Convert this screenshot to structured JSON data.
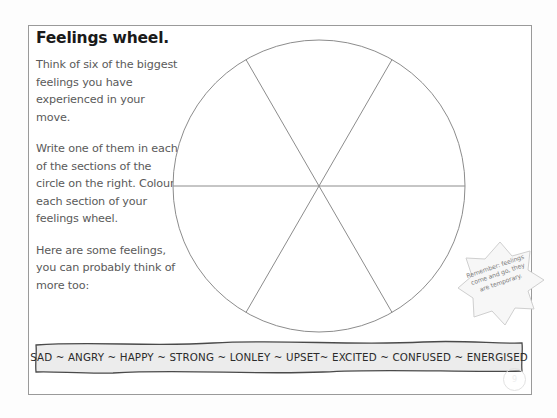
{
  "worksheet": {
    "title": "Feelings wheel.",
    "paragraphs": [
      "Think of six of the biggest feelings you have experienced in your move.",
      "Write one of them in each of the sections of the circle on the right. Colour each section of your feelings wheel.",
      "Here are some feelings, you can probably think of more too:"
    ]
  },
  "wheel": {
    "sections": 6,
    "center_x": 149,
    "center_y": 149,
    "radius": 146,
    "divider_angles_deg": [
      0,
      60,
      120
    ],
    "stroke_color": "#8c8c8c"
  },
  "reminder": {
    "text": "Remember: feelings come and go, they are temporary.",
    "shape": "starburst",
    "points": 8,
    "rotation_deg": -19,
    "fill_color": "#f7f7f7",
    "stroke_color": "#cfcfcf"
  },
  "word_bank": {
    "text": "SAD ~ ANGRY ~ HAPPY ~ STRONG ~ LONLEY ~ UPSET~ EXCITED ~ CONFUSED ~ ENERGISED",
    "words": [
      "SAD",
      "ANGRY",
      "HAPPY",
      "STRONG",
      "LONLEY",
      "UPSET",
      "EXCITED",
      "CONFUSED",
      "ENERGISED"
    ],
    "separator": "~",
    "fill_color": "#ececec",
    "stroke_color": "#4a4a4a"
  },
  "page_number": "9",
  "colors": {
    "frame_border": "#9a9a9a",
    "body_text": "#5a5a5a",
    "title_text": "#1a1a1a",
    "paper": "#ffffff"
  }
}
